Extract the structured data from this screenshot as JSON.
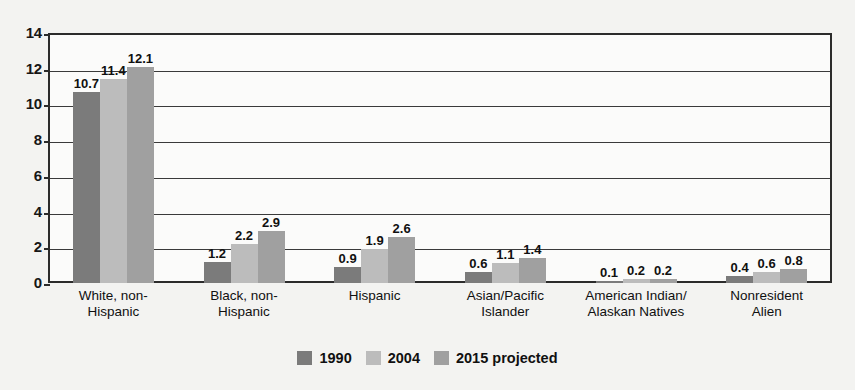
{
  "chart_data": {
    "type": "bar",
    "title": "",
    "xlabel": "",
    "ylabel": "",
    "ylim": [
      0,
      14
    ],
    "ytick_step": 2,
    "yticks": [
      "14",
      "12",
      "10",
      "8",
      "6",
      "4",
      "2",
      "0"
    ],
    "grid": true,
    "legend_position": "bottom-center",
    "categories": [
      "White, non-Hispanic",
      "Black, non-Hispanic",
      "Hispanic",
      "Asian/Pacific Islander",
      "American Indian/ Alaskan Natives",
      "Nonresident Alien"
    ],
    "category_lines": [
      [
        "White, non-",
        "Hispanic"
      ],
      [
        "Black, non-",
        "Hispanic"
      ],
      [
        "Hispanic",
        ""
      ],
      [
        "Asian/Pacific",
        "Islander"
      ],
      [
        "American Indian/",
        "Alaskan Natives"
      ],
      [
        "Nonresident",
        "Alien"
      ]
    ],
    "series": [
      {
        "name": "1990",
        "color": "#7b7b7b",
        "values": [
          10.7,
          1.2,
          0.9,
          0.6,
          0.1,
          0.4
        ],
        "labels": [
          "10.7",
          "1.2",
          "0.9",
          "0.6",
          "0.1",
          "0.4"
        ]
      },
      {
        "name": "2004",
        "color": "#bcbcbc",
        "values": [
          11.4,
          2.2,
          1.9,
          1.1,
          0.2,
          0.6
        ],
        "labels": [
          "11.4",
          "2.2",
          "1.9",
          "1.1",
          "0.2",
          "0.6"
        ]
      },
      {
        "name": "2015 projected",
        "color": "#a0a0a0",
        "values": [
          12.1,
          2.9,
          2.6,
          1.4,
          0.2,
          0.8
        ],
        "labels": [
          "12.1",
          "2.9",
          "2.6",
          "1.4",
          "0.2",
          "0.8"
        ]
      }
    ]
  },
  "legend": {
    "items": [
      {
        "label": "1990",
        "color": "#7b7b7b"
      },
      {
        "label": "2004",
        "color": "#bcbcbc"
      },
      {
        "label": "2015 projected",
        "color": "#a0a0a0"
      }
    ]
  },
  "colors": {
    "axis": "#2b2b2b",
    "grid": "#3a3a3a",
    "text": "#101010",
    "plot_background": "#fbfbfa",
    "page_background": "#f3f3f1"
  }
}
